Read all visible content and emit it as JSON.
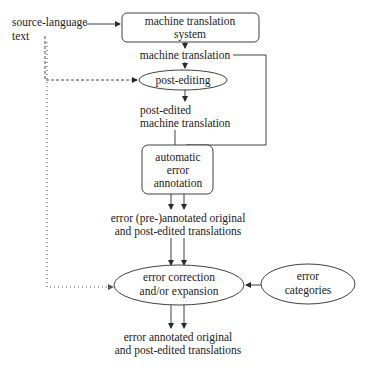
{
  "diagram": {
    "input": {
      "line1": "source-language",
      "line2": "text"
    },
    "nodes": {
      "mt_system": {
        "line1": "machine translation",
        "line2": "system",
        "shape": "rounded-rect"
      },
      "mt_output": {
        "label": "machine translation"
      },
      "post_editing": {
        "label": "post-editing",
        "shape": "ellipse"
      },
      "post_edited": {
        "line1": "post-edited",
        "line2": "machine translation"
      },
      "auto_annotation": {
        "line1": "automatic",
        "line2": "error",
        "line3": "annotation",
        "shape": "rounded-rect"
      },
      "pre_annotated": {
        "line1": "error (pre-)annotated original",
        "line2": "and post-edited translations"
      },
      "correction": {
        "line1": "error correction",
        "line2": "and/or expansion",
        "shape": "ellipse"
      },
      "categories": {
        "line1": "error",
        "line2": "categories",
        "shape": "ellipse"
      },
      "final_output": {
        "line1": "error annotated original",
        "line2": "and post-edited translations"
      }
    },
    "edges": [
      {
        "from": "source-language text",
        "to": "machine translation system",
        "style": "solid"
      },
      {
        "from": "machine translation system",
        "to": "machine translation",
        "style": "solid"
      },
      {
        "from": "machine translation",
        "to": "post-editing",
        "style": "solid"
      },
      {
        "from": "source-language text",
        "to": "post-editing",
        "style": "dashed"
      },
      {
        "from": "post-editing",
        "to": "post-edited machine translation",
        "style": "solid"
      },
      {
        "from": "post-edited machine translation",
        "to": "automatic error annotation",
        "style": "solid"
      },
      {
        "from": "machine translation",
        "to": "automatic error annotation",
        "style": "solid"
      },
      {
        "from": "automatic error annotation",
        "to": "error (pre-)annotated original and post-edited translations",
        "style": "solid-double"
      },
      {
        "from": "error (pre-)annotated original and post-edited translations",
        "to": "error correction and/or expansion",
        "style": "solid-double"
      },
      {
        "from": "source-language text",
        "to": "error correction and/or expansion",
        "style": "dotted"
      },
      {
        "from": "error categories",
        "to": "error correction and/or expansion",
        "style": "solid"
      },
      {
        "from": "error correction and/or expansion",
        "to": "error annotated original and post-edited translations",
        "style": "solid-double"
      }
    ]
  }
}
